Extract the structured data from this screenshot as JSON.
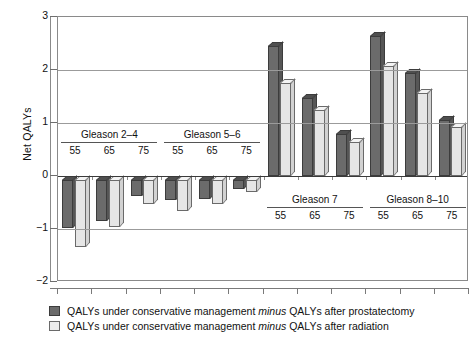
{
  "chart_data": {
    "type": "bar",
    "title": "",
    "xlabel": "",
    "ylabel": "Net QALYs",
    "ylim": [
      -2,
      3
    ],
    "yticks": [
      3,
      2,
      1,
      0,
      -1,
      -2
    ],
    "ytick_labels": [
      "3",
      "2",
      "1",
      "0",
      "−1",
      "−2"
    ],
    "grid": true,
    "legend_position": "bottom-left",
    "groups": [
      {
        "name": "Gleason 2–4",
        "label_side": "above-zero",
        "ages": [
          "55",
          "65",
          "75"
        ]
      },
      {
        "name": "Gleason 5–6",
        "label_side": "above-zero",
        "ages": [
          "55",
          "65",
          "75"
        ]
      },
      {
        "name": "Gleason 7",
        "label_side": "below-zero",
        "ages": [
          "55",
          "65",
          "75"
        ]
      },
      {
        "name": "Gleason 8–10",
        "label_side": "below-zero",
        "ages": [
          "55",
          "65",
          "75"
        ]
      }
    ],
    "categories": [
      "Gleason 2–4, 55",
      "Gleason 2–4, 65",
      "Gleason 2–4, 75",
      "Gleason 5–6, 55",
      "Gleason 5–6, 65",
      "Gleason 5–6, 75",
      "Gleason 7, 55",
      "Gleason 7, 65",
      "Gleason 7, 75",
      "Gleason 8–10, 55",
      "Gleason 8–10, 65",
      "Gleason 8–10, 75"
    ],
    "series": [
      {
        "name": "QALYs under conservative management minus QALYs after prostatectomy",
        "color": "#6b6b6b",
        "values": [
          -0.9,
          -0.78,
          -0.3,
          -0.38,
          -0.35,
          -0.17,
          2.45,
          1.48,
          0.8,
          2.65,
          1.95,
          1.05
        ]
      },
      {
        "name": "QALYs under conservative management minus QALYs after radiation",
        "color": "#e6e6e6",
        "values": [
          -1.27,
          -0.88,
          -0.45,
          -0.58,
          -0.45,
          -0.22,
          1.75,
          1.25,
          0.65,
          2.07,
          1.57,
          0.92
        ]
      }
    ]
  },
  "legend": {
    "items": [
      {
        "swatch": "dark",
        "prefix": "QALYs under conservative management ",
        "emph": "minus",
        "suffix": " QALYs after prostatectomy"
      },
      {
        "swatch": "light",
        "prefix": "QALYs under conservative management ",
        "emph": "minus",
        "suffix": " QALYs after radiation"
      }
    ]
  }
}
